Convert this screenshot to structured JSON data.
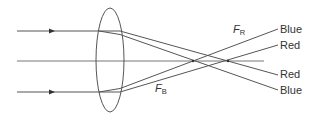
{
  "diagram": {
    "focal_labels": {
      "red": {
        "main": "F",
        "sub": "R"
      },
      "blue": {
        "main": "F",
        "sub": "B"
      }
    },
    "ray_labels": {
      "top_outer": "Blue",
      "top_inner": "Red",
      "bottom_inner": "Red",
      "bottom_outer": "Blue"
    },
    "colors": {
      "line": "#555555",
      "text": "#333333"
    },
    "order_note": "Blue light focuses closer to the lens (F_B) than red light (F_R)"
  }
}
